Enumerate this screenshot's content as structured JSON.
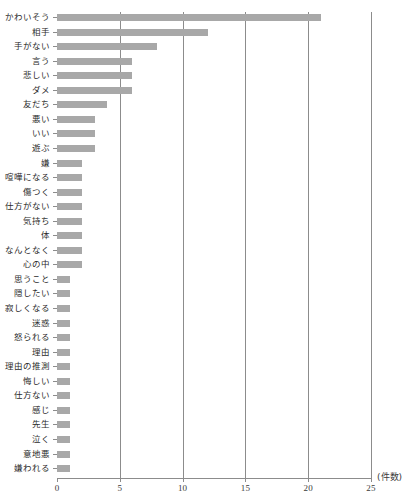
{
  "chart_data": {
    "type": "bar",
    "orientation": "horizontal",
    "title": "",
    "xlabel": "(件数)",
    "ylabel": "",
    "xlim": [
      0,
      25
    ],
    "xticks": [
      0,
      5,
      10,
      15,
      20,
      25
    ],
    "grid": true,
    "grid_axis": "x",
    "legend": null,
    "bar_color": "#a8a8a8",
    "categories": [
      "かわいそう",
      "相手",
      "手がない",
      "言う",
      "悲しい",
      "ダメ",
      "友だち",
      "悪い",
      "いい",
      "遊ぶ",
      "嫌",
      "喧嘩になる",
      "傷つく",
      "仕方がない",
      "気持ち",
      "体",
      "なんとなく",
      "心の中",
      "思うこと",
      "隠したい",
      "寂しくなる",
      "迷惑",
      "怒られる",
      "理由",
      "理由の推測",
      "悔しい",
      "仕方ない",
      "感じ",
      "先生",
      "泣く",
      "意地悪",
      "嫌われる"
    ],
    "values": [
      21,
      12,
      8,
      6,
      6,
      6,
      4,
      3,
      3,
      3,
      2,
      2,
      2,
      2,
      2,
      2,
      2,
      2,
      1,
      1,
      1,
      1,
      1,
      1,
      1,
      1,
      1,
      1,
      1,
      1,
      1,
      1
    ]
  },
  "axis": {
    "unit_label": "(件数)",
    "tick_labels": [
      "0",
      "5",
      "10",
      "15",
      "20",
      "25"
    ]
  }
}
